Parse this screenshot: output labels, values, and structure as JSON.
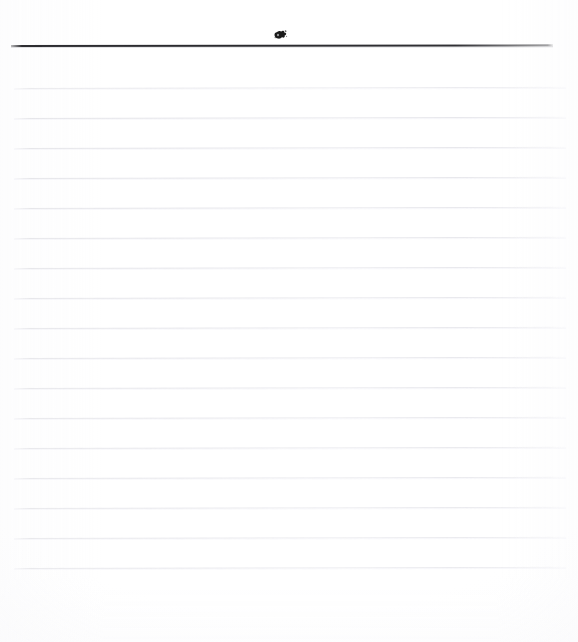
{
  "page": {
    "kind": "scanned-ruled-notepad-page",
    "width": 578,
    "height": 642,
    "background_color": "#fefefe",
    "text_content": "",
    "is_blank": "true"
  },
  "colors": {
    "paper": "#fefefe",
    "header_rule": "#2a2a2e",
    "ruled_line": "#e5e5ea",
    "ink_blot": "#1a1a1a"
  },
  "header": {
    "rule": {
      "name": "header-rule",
      "x": 11,
      "y": 45,
      "width": 542,
      "thickness": 2,
      "color": "#2a2a2e",
      "tilt_degrees": -0.07
    },
    "mark": {
      "name": "ink-blot-mark",
      "description": "ink-blot",
      "x": 273,
      "y": 28,
      "width": 16,
      "height": 14,
      "color": "#1a1a1a"
    }
  },
  "ruled_lines": {
    "count": 17,
    "spacing": 30,
    "left_x": 14,
    "right_x": 566,
    "color": "#e5e5ea",
    "thickness": 1,
    "tilt_degrees": -0.12,
    "positions": [
      88,
      118,
      148,
      178,
      208,
      238,
      268,
      298,
      328,
      358,
      388,
      418,
      448,
      478,
      508,
      538,
      568
    ]
  },
  "margins": {
    "top_band_height": 46,
    "bottom_band_height": 52,
    "left": 14,
    "right": 12
  }
}
